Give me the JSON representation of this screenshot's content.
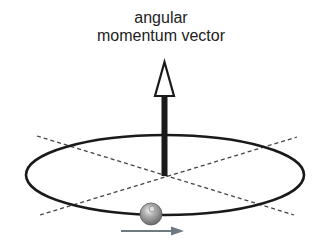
{
  "diagram": {
    "label_line1": "angular",
    "label_line2": "momentum vector",
    "elements": {
      "orbit": "elliptical orbit path",
      "vector": "angular momentum vector arrow pointing up from orbit center",
      "axes": "two dashed reference lines crossing at orbit center",
      "particle": "gray sphere on orbit",
      "motion_arrow": "gray arrow pointing right indicating direction of motion"
    },
    "colors": {
      "line": "#1a1a1a",
      "dashed": "#444444",
      "particle": "#8a8a8a",
      "motion_arrow": "#6f7a80"
    }
  }
}
